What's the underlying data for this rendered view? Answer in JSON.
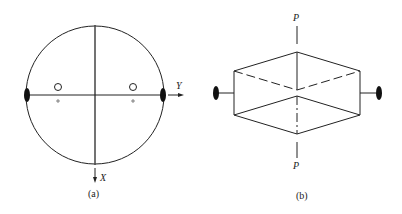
{
  "figure_a": {
    "caption": "(a)",
    "axis_y_label": "Y",
    "axis_x_label": "X",
    "symbols": {
      "two_fold_axis": "filled-lens",
      "poles_upper": "open-circle",
      "poles_lower": "plus"
    }
  },
  "figure_b": {
    "caption": "(b)",
    "axis_top_label": "P",
    "axis_bottom_label": "P",
    "symbols": {
      "two_fold_axis": "filled-lens"
    }
  },
  "colors": {
    "stroke": "#222222",
    "background": "#ffffff"
  }
}
